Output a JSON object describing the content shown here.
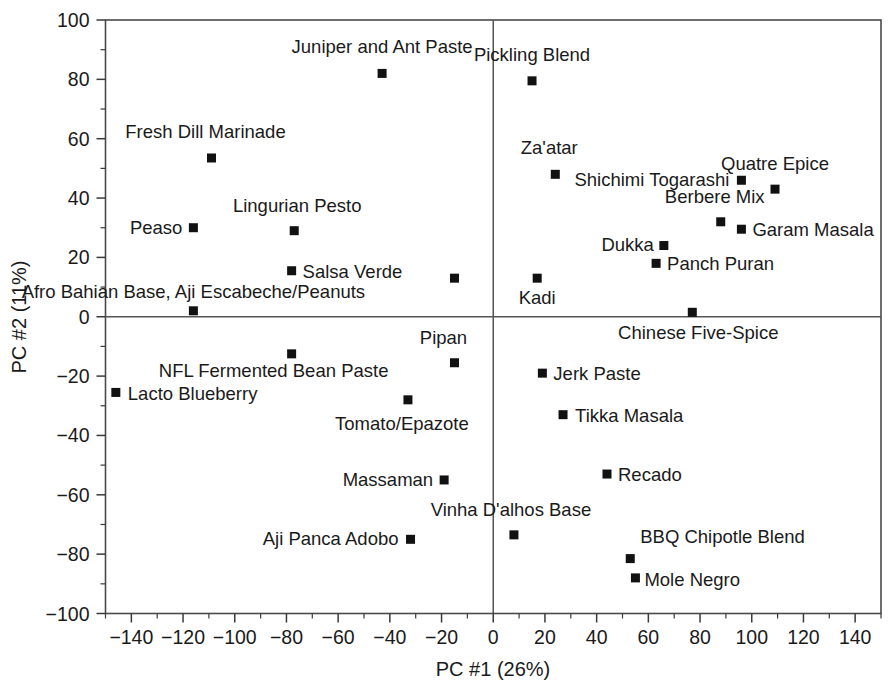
{
  "chart_data": {
    "type": "scatter",
    "title": "",
    "xlabel": "PC #1 (26%)",
    "ylabel": "PC #2 (11%)",
    "xlim": [
      -150,
      150
    ],
    "ylim": [
      -100,
      100
    ],
    "xticks": [
      -140,
      -120,
      -100,
      -80,
      -60,
      -40,
      -20,
      0,
      20,
      40,
      60,
      80,
      100,
      120,
      140
    ],
    "xticklabels": [
      "−140",
      "−120",
      "−100",
      "−80",
      "−60",
      "−40",
      "−20",
      "0",
      "20",
      "40",
      "60",
      "80",
      "100",
      "120",
      "140"
    ],
    "yticks": [
      -100,
      -80,
      -60,
      -40,
      -20,
      0,
      20,
      40,
      60,
      80,
      100
    ],
    "yticklabels": [
      "−100",
      "−80",
      "−60",
      "−40",
      "−20",
      "0",
      "20",
      "40",
      "60",
      "80",
      "100"
    ],
    "xtick_minor_step": 10,
    "ytick_minor_step": 10,
    "grid": false,
    "legend": false,
    "marker_color": "#111111",
    "marker_shape": "square",
    "zero_lines": true,
    "points": [
      {
        "label": "Juniper and Ant Paste",
        "x": -43,
        "y": 82,
        "label_dx": 0,
        "label_dy": -20,
        "anchor": "middle"
      },
      {
        "label": "Fresh Dill Marinade",
        "x": -109,
        "y": 53.5,
        "label_dx": -6,
        "label_dy": -20,
        "anchor": "middle"
      },
      {
        "label": "Peaso",
        "x": -116,
        "y": 30,
        "label_dx": -11,
        "label_dy": 6,
        "anchor": "end"
      },
      {
        "label": "Lingurian Pesto",
        "x": -77,
        "y": 29,
        "label_dx": 3,
        "label_dy": -19,
        "anchor": "middle"
      },
      {
        "label": "Salsa Verde",
        "x": -78,
        "y": 15.5,
        "label_dx": 11,
        "label_dy": 7,
        "anchor": "start"
      },
      {
        "label": "Afro Bahian Base, Aji Escabeche/Peanuts",
        "x": -116,
        "y": 2,
        "label_dx": 0,
        "label_dy": -13,
        "anchor": "middle"
      },
      {
        "label": "",
        "x": -15,
        "y": 13,
        "label_dx": 0,
        "label_dy": 0,
        "anchor": "middle"
      },
      {
        "label": "Pickling Blend",
        "x": 15,
        "y": 79.5,
        "label_dx": 0,
        "label_dy": -20,
        "anchor": "middle"
      },
      {
        "label": "Za'atar",
        "x": 24,
        "y": 48,
        "label_dx": -6,
        "label_dy": -20,
        "anchor": "middle"
      },
      {
        "label": "Shichimi Togarashi",
        "x": 96,
        "y": 46,
        "label_dx": -12,
        "label_dy": 6,
        "anchor": "end"
      },
      {
        "label": "Quatre Epice",
        "x": 109,
        "y": 43,
        "label_dx": 0,
        "label_dy": -19,
        "anchor": "middle"
      },
      {
        "label": "Berbere Mix",
        "x": 88,
        "y": 32,
        "label_dx": -6,
        "label_dy": -19,
        "anchor": "middle"
      },
      {
        "label": "Garam Masala",
        "x": 96,
        "y": 29.5,
        "label_dx": 11,
        "label_dy": 7,
        "anchor": "start"
      },
      {
        "label": "Dukka",
        "x": 66,
        "y": 24,
        "label_dx": -10,
        "label_dy": 5,
        "anchor": "end"
      },
      {
        "label": "Panch Puran",
        "x": 63,
        "y": 18,
        "label_dx": 11,
        "label_dy": 7,
        "anchor": "start"
      },
      {
        "label": "Kadi",
        "x": 17,
        "y": 13,
        "label_dx": 0,
        "label_dy": 26,
        "anchor": "middle"
      },
      {
        "label": "Chinese Five-Spice",
        "x": 77,
        "y": 1.5,
        "label_dx": 6,
        "label_dy": 27,
        "anchor": "middle"
      },
      {
        "label": "NFL Fermented Bean Paste",
        "x": -78,
        "y": -12.5,
        "label_dx": -18,
        "label_dy": 23,
        "anchor": "middle"
      },
      {
        "label": "Pipan",
        "x": -15,
        "y": -15.5,
        "label_dx": -11,
        "label_dy": -19,
        "anchor": "middle"
      },
      {
        "label": "Lacto Blueberry",
        "x": -146,
        "y": -25.5,
        "label_dx": 12,
        "label_dy": 8,
        "anchor": "start"
      },
      {
        "label": "Tomato/Epazote",
        "x": -33,
        "y": -28,
        "label_dx": -6,
        "label_dy": 30,
        "anchor": "middle"
      },
      {
        "label": "Massaman",
        "x": -19,
        "y": -55,
        "label_dx": -11,
        "label_dy": 6,
        "anchor": "end"
      },
      {
        "label": "Aji Panca Adobo",
        "x": -32,
        "y": -75,
        "label_dx": -12,
        "label_dy": 6,
        "anchor": "end"
      },
      {
        "label": "Jerk Paste",
        "x": 19,
        "y": -19,
        "label_dx": 11,
        "label_dy": 7,
        "anchor": "start"
      },
      {
        "label": "Tikka Masala",
        "x": 27,
        "y": -33,
        "label_dx": 12,
        "label_dy": 7,
        "anchor": "start"
      },
      {
        "label": "Recado",
        "x": 44,
        "y": -53,
        "label_dx": 11,
        "label_dy": 7,
        "anchor": "start"
      },
      {
        "label": "Vinha D'alhos Base",
        "x": 8,
        "y": -73.5,
        "label_dx": -3,
        "label_dy": -19,
        "anchor": "middle"
      },
      {
        "label": "BBQ Chipotle Blend",
        "x": 53,
        "y": -81.5,
        "label_dx": 10,
        "label_dy": -16,
        "anchor": "start"
      },
      {
        "label": "Mole Negro",
        "x": 55,
        "y": -88,
        "label_dx": 9,
        "label_dy": 8,
        "anchor": "start"
      }
    ]
  }
}
